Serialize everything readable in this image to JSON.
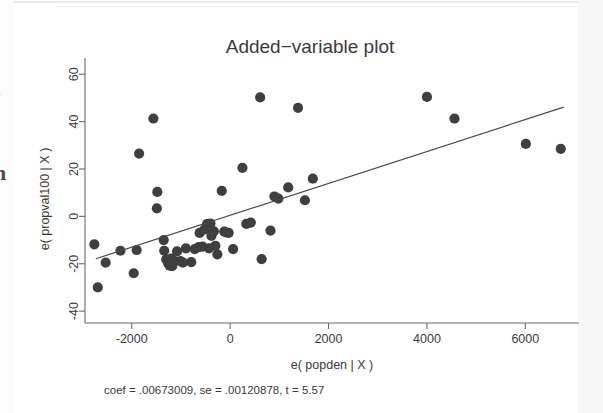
{
  "page": {
    "background_color": "#ffffff",
    "ink_color": "#3b3b3b",
    "marker_color": "#3f3f3f",
    "margin_glyph_lower": "n",
    "margin_glyph_upper": "r"
  },
  "chart_data": {
    "type": "scatter",
    "title": "Added−variable plot",
    "xlabel": "e( popden | X )",
    "ylabel": "e( propval100 | X )",
    "note": "coef = .00673009, se = .00120878, t = 5.57",
    "grid": false,
    "legend": null,
    "xlim": [
      -2950,
      7050
    ],
    "ylim": [
      -45,
      66
    ],
    "xticks": [
      -2000,
      0,
      2000,
      4000,
      6000
    ],
    "xtick_labels": [
      "-2000",
      "0",
      "2000",
      "4000",
      "6000"
    ],
    "yticks": [
      -40,
      -20,
      0,
      20,
      40,
      60
    ],
    "ytick_labels": [
      "-40",
      "-20",
      "0",
      "20",
      "40",
      "60"
    ],
    "fit": {
      "coef": 0.00673009,
      "se": 0.00120878,
      "t": 5.57,
      "intercept": 0.5,
      "x_start": -2730,
      "x_end": 6780,
      "y_start": -17.9,
      "y_end": 46.1
    },
    "points": [
      {
        "x": -2760,
        "y": -11.8
      },
      {
        "x": -2690,
        "y": -30.0
      },
      {
        "x": -2530,
        "y": -19.5
      },
      {
        "x": -2230,
        "y": -14.5
      },
      {
        "x": -1960,
        "y": -24.0
      },
      {
        "x": -1900,
        "y": -14.2
      },
      {
        "x": -1850,
        "y": 26.5
      },
      {
        "x": -1560,
        "y": 41.3
      },
      {
        "x": -1480,
        "y": 10.3
      },
      {
        "x": -1490,
        "y": 3.4
      },
      {
        "x": -1350,
        "y": -10.0
      },
      {
        "x": -1340,
        "y": -14.5
      },
      {
        "x": -1300,
        "y": -18.2
      },
      {
        "x": -1260,
        "y": -19.8
      },
      {
        "x": -1230,
        "y": -20.8
      },
      {
        "x": -1200,
        "y": -17.8
      },
      {
        "x": -1180,
        "y": -21.0
      },
      {
        "x": -1120,
        "y": -19.0
      },
      {
        "x": -1080,
        "y": -14.8
      },
      {
        "x": -1010,
        "y": -18.9
      },
      {
        "x": -960,
        "y": -19.5
      },
      {
        "x": -900,
        "y": -13.5
      },
      {
        "x": -790,
        "y": -19.3
      },
      {
        "x": -720,
        "y": -13.8
      },
      {
        "x": -640,
        "y": -13.0
      },
      {
        "x": -620,
        "y": -7.0
      },
      {
        "x": -560,
        "y": -12.8
      },
      {
        "x": -520,
        "y": -5.5
      },
      {
        "x": -470,
        "y": -3.3
      },
      {
        "x": -430,
        "y": -13.5
      },
      {
        "x": -400,
        "y": -3.0
      },
      {
        "x": -380,
        "y": -8.2
      },
      {
        "x": -330,
        "y": -6.3
      },
      {
        "x": -300,
        "y": -12.4
      },
      {
        "x": -260,
        "y": -16.0
      },
      {
        "x": -170,
        "y": 10.8
      },
      {
        "x": -120,
        "y": -6.4
      },
      {
        "x": -80,
        "y": -6.8
      },
      {
        "x": -30,
        "y": -7.0
      },
      {
        "x": 60,
        "y": -13.8
      },
      {
        "x": 250,
        "y": 20.5
      },
      {
        "x": 330,
        "y": -3.2
      },
      {
        "x": 420,
        "y": -2.6
      },
      {
        "x": 610,
        "y": 50.2
      },
      {
        "x": 640,
        "y": -18.0
      },
      {
        "x": 820,
        "y": -6.0
      },
      {
        "x": 900,
        "y": 8.4
      },
      {
        "x": 980,
        "y": 7.5
      },
      {
        "x": 1180,
        "y": 12.2
      },
      {
        "x": 1380,
        "y": 45.8
      },
      {
        "x": 1520,
        "y": 6.8
      },
      {
        "x": 1680,
        "y": 15.9
      },
      {
        "x": 4000,
        "y": 50.4
      },
      {
        "x": 4560,
        "y": 41.3
      },
      {
        "x": 6010,
        "y": 30.6
      },
      {
        "x": 6720,
        "y": 28.5
      }
    ]
  }
}
